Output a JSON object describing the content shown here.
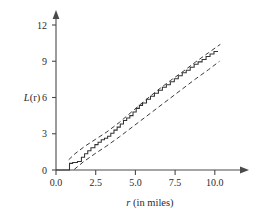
{
  "chart_data": {
    "type": "line",
    "title": "",
    "subtitle": "",
    "xlabel": "r (in miles)",
    "xlabel_italic_part": "r",
    "xlabel_rest": " (in miles)",
    "ylabel": "L(r)",
    "ylabel_italic_part": "L",
    "ylabel_rest": "(r)",
    "xlim": [
      0.0,
      10.6
    ],
    "ylim": [
      0.0,
      12.6
    ],
    "xticks": [
      0.0,
      2.5,
      5.0,
      7.5,
      10.0
    ],
    "xtick_labels": [
      "0.0",
      "2.5",
      "5.0",
      "7.5",
      "10.0"
    ],
    "yticks": [
      0,
      3,
      6,
      9,
      12
    ],
    "ytick_labels": [
      "0",
      "3",
      "6",
      "9",
      "12"
    ],
    "grid": false,
    "legend": "none",
    "axis_arrows": true,
    "series": [
      {
        "name": "L(r) empirical",
        "style": "solid-step",
        "color": "#333333",
        "x": [
          0.0,
          0.85,
          0.85,
          1.05,
          1.05,
          1.35,
          1.35,
          1.6,
          1.6,
          1.8,
          1.8,
          2.0,
          2.0,
          2.2,
          2.2,
          2.45,
          2.45,
          2.65,
          2.65,
          2.85,
          2.85,
          3.05,
          3.05,
          3.25,
          3.25,
          3.45,
          3.45,
          3.65,
          3.65,
          3.85,
          3.85,
          4.05,
          4.05,
          4.25,
          4.25,
          4.45,
          4.45,
          4.65,
          4.65,
          4.85,
          4.85,
          5.05,
          5.05,
          5.25,
          5.25,
          5.45,
          5.45,
          5.7,
          5.7,
          5.95,
          5.95,
          6.2,
          6.2,
          6.45,
          6.45,
          6.7,
          6.7,
          6.95,
          6.95,
          7.2,
          7.2,
          7.45,
          7.45,
          7.7,
          7.7,
          7.95,
          7.95,
          8.2,
          8.2,
          8.45,
          8.45,
          8.7,
          8.7,
          8.95,
          8.95,
          9.2,
          9.2,
          9.45,
          9.45,
          9.7,
          9.7,
          9.95,
          9.95,
          10.2
        ],
        "y": [
          0.0,
          0.0,
          0.55,
          0.55,
          0.62,
          0.62,
          0.7,
          0.7,
          1.05,
          1.05,
          1.35,
          1.35,
          1.6,
          1.6,
          1.85,
          1.85,
          2.1,
          2.1,
          2.3,
          2.3,
          2.5,
          2.5,
          2.62,
          2.62,
          2.8,
          2.8,
          3.05,
          3.05,
          3.3,
          3.3,
          3.55,
          3.55,
          3.8,
          3.8,
          4.1,
          4.1,
          4.3,
          4.3,
          4.5,
          4.5,
          4.8,
          4.8,
          5.1,
          5.1,
          5.35,
          5.35,
          5.55,
          5.55,
          5.85,
          5.85,
          6.1,
          6.1,
          6.35,
          6.35,
          6.6,
          6.6,
          6.85,
          6.85,
          7.05,
          7.05,
          7.3,
          7.3,
          7.55,
          7.55,
          7.8,
          7.8,
          8.05,
          8.05,
          8.25,
          8.25,
          8.5,
          8.5,
          8.75,
          8.75,
          8.95,
          8.95,
          9.15,
          9.15,
          9.4,
          9.4,
          9.6,
          9.6,
          9.8,
          9.8
        ]
      },
      {
        "name": "upper envelope",
        "style": "dashed",
        "color": "#3a3a3a",
        "x": [
          0.8,
          1.2,
          1.8,
          2.5,
          3.2,
          4.0,
          4.8,
          5.6,
          6.4,
          7.2,
          8.0,
          8.8,
          9.6,
          10.35
        ],
        "y": [
          0.85,
          1.35,
          1.95,
          2.55,
          3.15,
          3.95,
          4.85,
          5.75,
          6.6,
          7.4,
          8.15,
          8.95,
          9.7,
          10.4
        ]
      },
      {
        "name": "lower envelope",
        "style": "dashed",
        "color": "#3a3a3a",
        "x": [
          1.15,
          1.7,
          2.4,
          3.2,
          4.0,
          4.8,
          5.6,
          6.4,
          7.2,
          8.0,
          8.8,
          9.6,
          10.3
        ],
        "y": [
          0.05,
          0.65,
          1.3,
          2.0,
          2.75,
          3.55,
          4.35,
          5.15,
          5.95,
          6.75,
          7.55,
          8.3,
          9.0
        ]
      }
    ]
  },
  "colors": {
    "background": "#ffffff",
    "axis": "#4a4a4a",
    "series_solid": "#333333",
    "series_dashed": "#3a3a3a",
    "text": "#2b2b2b"
  }
}
